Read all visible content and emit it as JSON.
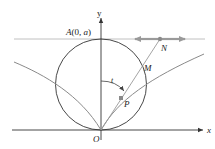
{
  "diagram": {
    "type": "geometric construction (cissoid of Diocles)",
    "axes": {
      "x_label": "x",
      "y_label": "y",
      "origin_label": "O"
    },
    "points": {
      "A": {
        "label_prefix": "A",
        "label_args": "(0, ",
        "label_a": "a",
        "label_suffix": ")"
      },
      "N": {
        "label": "N"
      },
      "M": {
        "label": "M"
      },
      "P": {
        "label": "P"
      }
    },
    "angle": {
      "label": "t"
    },
    "colors": {
      "axis": "#333333",
      "circle": "#333333",
      "curve": "#8a8a8a",
      "ray": "#9a9a9a",
      "tangent_line": "#aaaaaa",
      "slider_arrows": "#9a9a9a",
      "point_marker": "#8a8a8a"
    }
  }
}
